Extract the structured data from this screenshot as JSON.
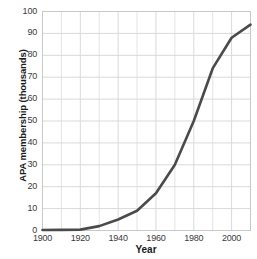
{
  "chart_data": {
    "type": "line",
    "title": "",
    "xlabel": "Year",
    "ylabel": "APA membership (thousands)",
    "xlim": [
      1900,
      2010
    ],
    "ylim": [
      0,
      100
    ],
    "xticks": [
      "1900",
      "1920",
      "1940",
      "1960",
      "1980",
      "2000"
    ],
    "xtick_values": [
      1900,
      1920,
      1940,
      1960,
      1980,
      2000
    ],
    "yticks": [
      "0",
      "10",
      "20",
      "30",
      "40",
      "50",
      "60",
      "70",
      "80",
      "90",
      "100"
    ],
    "ytick_values": [
      0,
      10,
      20,
      30,
      40,
      50,
      60,
      70,
      80,
      90,
      100
    ],
    "grid": true,
    "legend": false,
    "line_color": "#4a4a4a",
    "grid_color": "#d9d9d9",
    "x": [
      1900,
      1910,
      1920,
      1930,
      1940,
      1950,
      1960,
      1970,
      1980,
      1990,
      2000,
      2010
    ],
    "values": [
      0.2,
      0.3,
      0.4,
      2,
      5,
      9,
      17,
      30,
      50,
      74,
      88,
      94
    ],
    "series": [
      {
        "name": "APA membership",
        "values": [
          0.2,
          0.3,
          0.4,
          2,
          5,
          9,
          17,
          30,
          50,
          74,
          88,
          94
        ]
      }
    ]
  }
}
